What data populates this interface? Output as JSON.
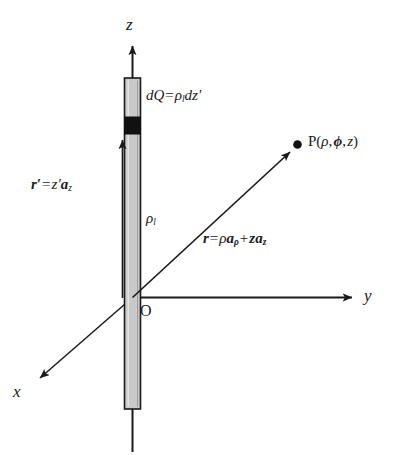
{
  "figure": {
    "background_color": "#ffffff",
    "ink_color": "#1a1a1a",
    "rod_fill_color": "#c9c9c9",
    "rod_edge_color": "#1a1a1a",
    "element_color": "#111111"
  },
  "axes": [
    {
      "name": "z-axis",
      "label": "z",
      "direction": "up"
    },
    {
      "name": "y-axis",
      "label": "y",
      "direction": "right"
    },
    {
      "name": "x-axis",
      "label": "x",
      "direction": "down-left"
    }
  ],
  "labels": {
    "z_axis": "z",
    "y_axis": "y",
    "x_axis": "x",
    "origin": "O"
  },
  "annotations": {
    "charge_element": {
      "name": "dQ-equation",
      "lhs": "dQ",
      "equals": "=",
      "rho": "ρ",
      "rho_sub": "l",
      "rhs_tail": "dz",
      "prime": "′"
    },
    "source_vector": {
      "name": "r-prime-equation",
      "r": "r",
      "r_prime": "′",
      "equals": "=",
      "z": "z",
      "z_prime": "′",
      "a": "a",
      "a_sub": "z"
    },
    "field_vector": {
      "name": "r-equation",
      "r": "r",
      "equals": "=",
      "rho": "ρ",
      "a1": "a",
      "a1_sub": "ρ",
      "plus": "+",
      "z": "z",
      "a2": "a",
      "a2_sub": "z"
    },
    "line_density": {
      "name": "line-charge-density",
      "rho": "ρ",
      "sub": "l"
    },
    "field_point": {
      "name": "field-point-P",
      "p": "P",
      "open": "(",
      "rho": "ρ",
      "comma1": ",",
      "phi": "ϕ",
      "comma2": ",",
      "z": "z",
      "close": ")"
    }
  }
}
